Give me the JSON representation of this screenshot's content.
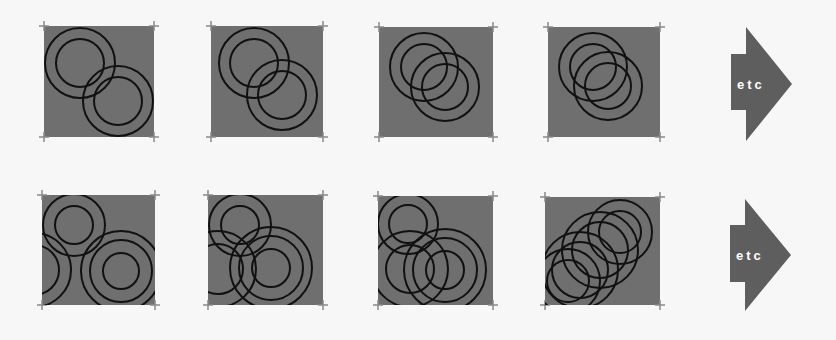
{
  "colors": {
    "background": "#f7f7f7",
    "panel_fill": "#6f6f6f",
    "circle_stroke": "#111111",
    "tick_color": "#8a8a8a",
    "arrow_fill": "#5e5e5e",
    "arrow_text": "#ffffff"
  },
  "rows": [
    {
      "name": "row-1",
      "panels": [
        {
          "x": 44,
          "y": 26,
          "w": 110,
          "h": 111,
          "circles": [
            {
              "cx": 80,
              "cy": 63,
              "r": 35
            },
            {
              "cx": 80,
              "cy": 63,
              "r": 24
            },
            {
              "cx": 118,
              "cy": 101,
              "r": 35
            },
            {
              "cx": 118,
              "cy": 101,
              "r": 24
            }
          ]
        },
        {
          "x": 211,
          "y": 26,
          "w": 112,
          "h": 111,
          "circles": [
            {
              "cx": 254,
              "cy": 63,
              "r": 35
            },
            {
              "cx": 254,
              "cy": 63,
              "r": 24
            },
            {
              "cx": 282,
              "cy": 95,
              "r": 35
            },
            {
              "cx": 282,
              "cy": 95,
              "r": 24
            }
          ]
        },
        {
          "x": 379,
          "y": 27,
          "w": 114,
          "h": 110,
          "circles": [
            {
              "cx": 424,
              "cy": 67,
              "r": 34
            },
            {
              "cx": 424,
              "cy": 67,
              "r": 23
            },
            {
              "cx": 445,
              "cy": 87,
              "r": 34
            },
            {
              "cx": 445,
              "cy": 87,
              "r": 23
            }
          ]
        },
        {
          "x": 548,
          "y": 27,
          "w": 112,
          "h": 110,
          "circles": [
            {
              "cx": 593,
              "cy": 67,
              "r": 34
            },
            {
              "cx": 593,
              "cy": 67,
              "r": 23
            },
            {
              "cx": 608,
              "cy": 86,
              "r": 34
            },
            {
              "cx": 608,
              "cy": 86,
              "r": 23
            }
          ]
        }
      ],
      "arrow": {
        "rect_x": 731,
        "rect_y": 54,
        "rect_w": 15,
        "rect_h": 56,
        "tri_top": 27,
        "tri_bottom": 141,
        "tip_x": 792,
        "tip_y": 84,
        "label": "etc"
      }
    },
    {
      "name": "row-2",
      "panels": [
        {
          "x": 42,
          "y": 195,
          "w": 113,
          "h": 110,
          "circles": [
            {
              "cx": 74,
              "cy": 225,
              "r": 31
            },
            {
              "cx": 74,
              "cy": 225,
              "r": 19
            },
            {
              "cx": 34,
              "cy": 270,
              "r": 37
            },
            {
              "cx": 34,
              "cy": 270,
              "r": 25
            },
            {
              "cx": 121,
              "cy": 271,
              "r": 40
            },
            {
              "cx": 121,
              "cy": 271,
              "r": 31
            },
            {
              "cx": 121,
              "cy": 271,
              "r": 18
            }
          ]
        },
        {
          "x": 208,
          "y": 195,
          "w": 115,
          "h": 110,
          "circles": [
            {
              "cx": 240,
              "cy": 225,
              "r": 31
            },
            {
              "cx": 240,
              "cy": 225,
              "r": 19
            },
            {
              "cx": 218,
              "cy": 269,
              "r": 38
            },
            {
              "cx": 218,
              "cy": 269,
              "r": 25
            },
            {
              "cx": 271,
              "cy": 268,
              "r": 41
            },
            {
              "cx": 271,
              "cy": 268,
              "r": 32
            },
            {
              "cx": 271,
              "cy": 268,
              "r": 19
            }
          ]
        },
        {
          "x": 378,
          "y": 196,
          "w": 115,
          "h": 109,
          "circles": [
            {
              "cx": 408,
              "cy": 224,
              "r": 30
            },
            {
              "cx": 408,
              "cy": 224,
              "r": 19
            },
            {
              "cx": 410,
              "cy": 269,
              "r": 38
            },
            {
              "cx": 410,
              "cy": 269,
              "r": 24
            },
            {
              "cx": 445,
              "cy": 270,
              "r": 41
            },
            {
              "cx": 445,
              "cy": 270,
              "r": 32
            },
            {
              "cx": 445,
              "cy": 270,
              "r": 19
            }
          ]
        },
        {
          "x": 545,
          "y": 197,
          "w": 115,
          "h": 108,
          "circles": [
            {
              "cx": 620,
              "cy": 232,
              "r": 32
            },
            {
              "cx": 620,
              "cy": 232,
              "r": 21
            },
            {
              "cx": 600,
              "cy": 250,
              "r": 38
            },
            {
              "cx": 600,
              "cy": 250,
              "r": 28
            },
            {
              "cx": 580,
              "cy": 270,
              "r": 38
            },
            {
              "cx": 580,
              "cy": 270,
              "r": 28
            },
            {
              "cx": 568,
              "cy": 281,
              "r": 32
            },
            {
              "cx": 568,
              "cy": 281,
              "r": 21
            }
          ]
        }
      ],
      "arrow": {
        "rect_x": 730,
        "rect_y": 225,
        "rect_w": 15,
        "rect_h": 57,
        "tri_top": 199,
        "tri_bottom": 311,
        "tip_x": 791,
        "tip_y": 255,
        "label": "etc"
      }
    }
  ]
}
